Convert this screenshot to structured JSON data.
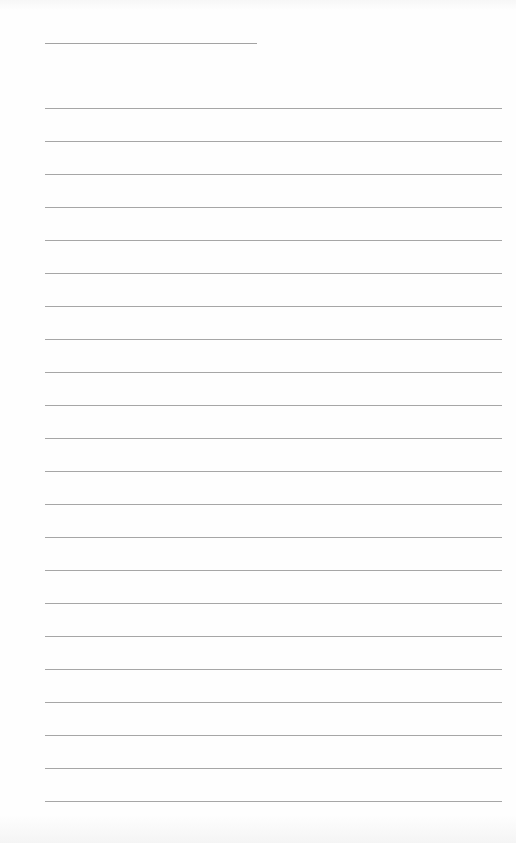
{
  "document": {
    "type": "lined-paper",
    "title_line": {
      "x": 45,
      "y": 43,
      "width": 212,
      "text": ""
    },
    "ruled_lines": {
      "count": 22,
      "start_y": 108,
      "spacing": 33,
      "x": 45,
      "width": 457,
      "entries": [
        "",
        "",
        "",
        "",
        "",
        "",
        "",
        "",
        "",
        "",
        "",
        "",
        "",
        "",
        "",
        "",
        "",
        "",
        "",
        "",
        "",
        ""
      ]
    },
    "colors": {
      "paper": "#fefefe",
      "rule": "#a6a6a6"
    }
  }
}
